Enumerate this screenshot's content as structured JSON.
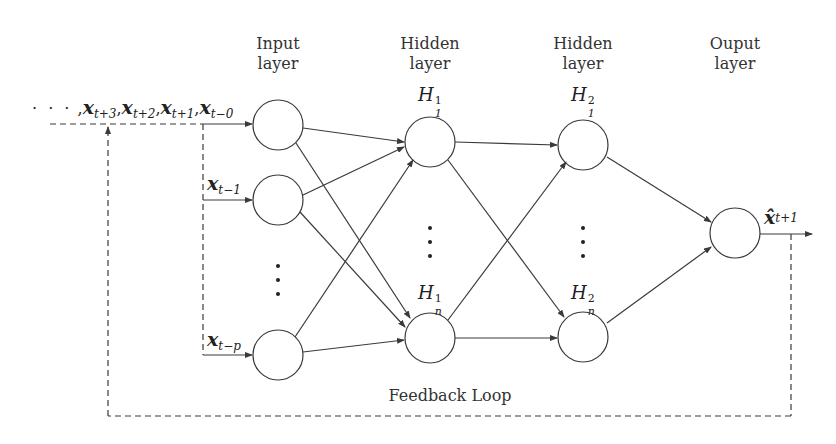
{
  "layers": {
    "input": {
      "title_line1": "Input",
      "title_line2": "layer"
    },
    "hidden1": {
      "title_line1": "Hidden",
      "title_line2": "layer",
      "node_top": {
        "base": "H",
        "sup": "1",
        "sub": "1"
      },
      "node_bottom": {
        "base": "H",
        "sup": "1",
        "sub": "n"
      }
    },
    "hidden2": {
      "title_line1": "Hidden",
      "title_line2": "layer",
      "node_top": {
        "base": "H",
        "sup": "2",
        "sub": "1"
      },
      "node_bottom": {
        "base": "H",
        "sup": "2",
        "sub": "n"
      }
    },
    "output": {
      "title_line1": "Ouput",
      "title_line2": "layer"
    }
  },
  "inputs": {
    "sequence": {
      "leading_dots": "· · ·",
      "items": [
        {
          "base": "x",
          "sub": "t+3"
        },
        {
          "base": "x",
          "sub": "t+2"
        },
        {
          "base": "x",
          "sub": "t+1"
        },
        {
          "base": "x",
          "sub": "t−0"
        }
      ],
      "separator": ","
    },
    "x_t1": {
      "base": "x",
      "sub": "t−1"
    },
    "x_tp": {
      "base": "x",
      "sub": "t−p"
    }
  },
  "output_label": {
    "base": "x̂",
    "sub": "t+1"
  },
  "feedback": {
    "label": "Feedback Loop"
  },
  "colors": {
    "stroke": "#3a3a3a",
    "background": "#ffffff"
  }
}
